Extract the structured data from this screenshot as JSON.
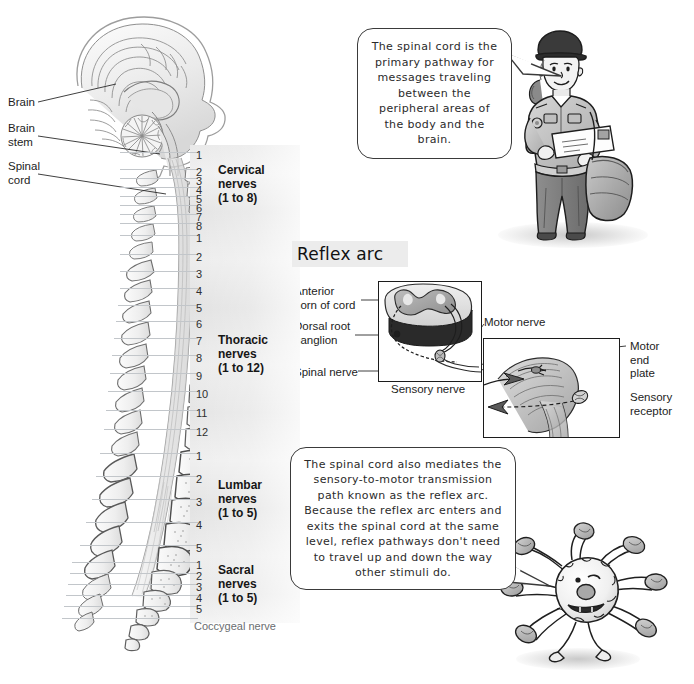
{
  "page": {
    "background": "#ffffff",
    "width": 694,
    "height": 684
  },
  "spine_figure": {
    "labels": [
      {
        "id": "brain",
        "text": "Brain",
        "x": 8,
        "y": 96
      },
      {
        "id": "brain-stem",
        "text": "Brain\nstem",
        "x": 8,
        "y": 122
      },
      {
        "id": "spinal-cord",
        "text": "Spinal\ncord",
        "x": 8,
        "y": 160
      }
    ]
  },
  "nerve_groups": [
    {
      "id": "cervical",
      "name": "Cervical\nnerves\n(1 to 8)",
      "label_y": 163,
      "numbers": [
        "1",
        "2",
        "3",
        "4",
        "5",
        "6",
        "7",
        "8"
      ],
      "number_ys": [
        150,
        167,
        176,
        185,
        194,
        203,
        212,
        221
      ]
    },
    {
      "id": "thoracic",
      "name": "Thoracic\nnerves\n(1 to 12)",
      "label_y": 333,
      "numbers": [
        "1",
        "2",
        "3",
        "4",
        "5",
        "6",
        "7",
        "8",
        "9",
        "10",
        "11",
        "12"
      ],
      "number_ys": [
        233,
        252,
        269,
        286,
        303,
        319,
        336,
        353,
        371,
        389,
        408,
        427
      ]
    },
    {
      "id": "lumbar",
      "name": "Lumbar\nnerves\n(1 to 5)",
      "label_y": 478,
      "numbers": [
        "1",
        "2",
        "3",
        "4",
        "5"
      ],
      "number_ys": [
        451,
        474,
        497,
        520,
        543
      ]
    },
    {
      "id": "sacral",
      "name": "Sacral\nnerves\n(1 to 5)",
      "label_y": 563,
      "numbers": [
        "1",
        "2",
        "3",
        "4",
        "5"
      ],
      "number_ys": [
        560,
        571,
        582,
        593,
        604
      ]
    }
  ],
  "coccygeal": {
    "text": "Coccygeal nerve",
    "y": 620
  },
  "reflex_arc": {
    "title": "Reflex arc",
    "cord_panel_labels": [
      {
        "id": "anterior-horn",
        "text": "Anterior\nhorn of cord",
        "x": 294,
        "y": 285
      },
      {
        "id": "dorsal-root-ganglion",
        "text": "Dorsal root\nganglion",
        "x": 294,
        "y": 320
      },
      {
        "id": "spinal-nerve",
        "text": "Spinal nerve",
        "x": 294,
        "y": 366
      },
      {
        "id": "sensory-nerve",
        "text": "Sensory nerve",
        "x": 391,
        "y": 383
      }
    ],
    "limb_panel_labels": [
      {
        "id": "motor-nerve",
        "text": "Motor nerve",
        "x": 484,
        "y": 316
      },
      {
        "id": "motor-end-plate",
        "text": "Motor\nend\nplate",
        "x": 630,
        "y": 340
      },
      {
        "id": "sensory-receptor",
        "text": "Sensory\nreceptor",
        "x": 630,
        "y": 391
      }
    ]
  },
  "callouts": [
    {
      "id": "top-callout",
      "text": "The spinal cord is the primary pathway for messages traveling between the peripheral areas of the body and the brain.",
      "x": 357,
      "y": 28,
      "w": 155,
      "h": 131
    },
    {
      "id": "bottom-callout",
      "text": "The spinal cord also mediates the sensory-to-motor transmission path known as the reflex arc. Because the reflex arc enters and exits the spinal cord at the same level, reflex pathways don't need to travel up and down the way other stimuli do.",
      "x": 290,
      "y": 447,
      "w": 226,
      "h": 143
    }
  ],
  "illustrations": [
    {
      "id": "mail-carrier",
      "name": "mail-carrier-figure",
      "x": 500,
      "y": 30,
      "w": 135,
      "h": 210
    },
    {
      "id": "neuron-guy",
      "name": "neuron-character",
      "x": 500,
      "y": 528,
      "w": 185,
      "h": 150
    }
  ],
  "colors": {
    "ink": "#1d1d1d",
    "leader": "#2a2a2a",
    "band_grey": "#e8e8e8",
    "uniform_grey": "#9a9a9a",
    "dark_grey": "#4e4e4e",
    "panel_border": "#1c1c1c",
    "nerve_line": "#c2c6ca"
  }
}
